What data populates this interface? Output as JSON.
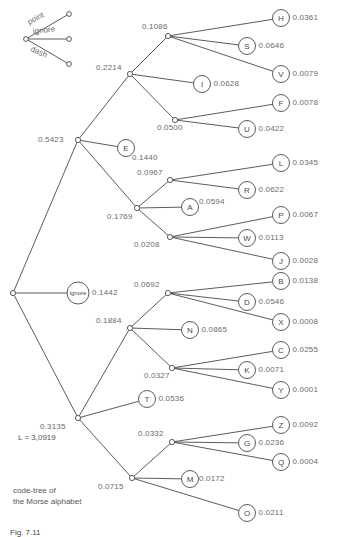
{
  "figure": {
    "title_lines": [
      "code-tree of",
      "the Morse alphabet"
    ],
    "cost_label": "L = 3,0919",
    "caption": "Fig. 7.11"
  },
  "legend": {
    "items": [
      {
        "name": "point",
        "label": "point"
      },
      {
        "name": "ignore",
        "label": "ignore"
      },
      {
        "name": "dash",
        "label": "dash"
      }
    ]
  },
  "chart_data": {
    "type": "tree",
    "cost": "L = 3,0919",
    "edge_types": [
      "point",
      "ignore",
      "dash"
    ],
    "internal_nodes": [
      {
        "id": "n-root",
        "value": "",
        "x": 13,
        "y": 293
      },
      {
        "id": "n-5423",
        "value": "0.5423",
        "x": 78,
        "y": 140
      },
      {
        "id": "n-2214",
        "value": "0.2214",
        "x": 130,
        "y": 74
      },
      {
        "id": "n-1086",
        "value": "0.1086",
        "x": 168,
        "y": 36
      },
      {
        "id": "n-0500",
        "value": "0.0500",
        "x": 175,
        "y": 120
      },
      {
        "id": "n-1769",
        "value": "0.1769",
        "x": 137,
        "y": 208
      },
      {
        "id": "n-0967",
        "value": "0.0967",
        "x": 170,
        "y": 180
      },
      {
        "id": "n-0208",
        "value": "0.0208",
        "x": 170,
        "y": 237
      },
      {
        "id": "n-3135",
        "value": "0.3135",
        "x": 78,
        "y": 418
      },
      {
        "id": "n-1884",
        "value": "0.1884",
        "x": 130,
        "y": 328
      },
      {
        "id": "n-0692",
        "value": "0.0692",
        "x": 168,
        "y": 293
      },
      {
        "id": "n-0327",
        "value": "0.0327",
        "x": 172,
        "y": 368
      },
      {
        "id": "n-0715",
        "value": "0.0715",
        "x": 132,
        "y": 478
      },
      {
        "id": "n-0332",
        "value": "0.0332",
        "x": 172,
        "y": 442
      }
    ],
    "leaves": [
      {
        "letter": "H",
        "value": "0.0361",
        "x": 281,
        "y": 18
      },
      {
        "letter": "S",
        "value": "0.0646",
        "x": 247,
        "y": 46
      },
      {
        "letter": "V",
        "value": "0.0079",
        "x": 281,
        "y": 74
      },
      {
        "letter": "I",
        "value": "0.0628",
        "x": 202,
        "y": 84
      },
      {
        "letter": "F",
        "value": "0.0078",
        "x": 281,
        "y": 103
      },
      {
        "letter": "U",
        "value": "0.0422",
        "x": 247,
        "y": 129
      },
      {
        "letter": "E",
        "value": "0.1440",
        "x": 126,
        "y": 148
      },
      {
        "letter": "L",
        "value": "0.0345",
        "x": 281,
        "y": 163
      },
      {
        "letter": "R",
        "value": "0.0622",
        "x": 247,
        "y": 190
      },
      {
        "letter": "A",
        "value": "0.0594",
        "x": 190,
        "y": 207
      },
      {
        "letter": "P",
        "value": "0.0067",
        "x": 281,
        "y": 215
      },
      {
        "letter": "W",
        "value": "0.0113",
        "x": 247,
        "y": 238
      },
      {
        "letter": "J",
        "value": "0.0028",
        "x": 281,
        "y": 261
      },
      {
        "letter": "ignore",
        "value": "0.1442",
        "x": 78,
        "y": 293
      },
      {
        "letter": "B",
        "value": "0.0138",
        "x": 281,
        "y": 281
      },
      {
        "letter": "D",
        "value": "0.0546",
        "x": 247,
        "y": 302
      },
      {
        "letter": "X",
        "value": "0.0008",
        "x": 281,
        "y": 322
      },
      {
        "letter": "N",
        "value": "0.0865",
        "x": 190,
        "y": 330
      },
      {
        "letter": "C",
        "value": "0.0255",
        "x": 281,
        "y": 350
      },
      {
        "letter": "K",
        "value": "0.0071",
        "x": 247,
        "y": 370
      },
      {
        "letter": "Y",
        "value": "0.0001",
        "x": 281,
        "y": 390
      },
      {
        "letter": "T",
        "value": "0.0536",
        "x": 147,
        "y": 399
      },
      {
        "letter": "Z",
        "value": "0.0092",
        "x": 281,
        "y": 425
      },
      {
        "letter": "G",
        "value": "0.0236",
        "x": 247,
        "y": 443
      },
      {
        "letter": "Q",
        "value": "0.0004",
        "x": 281,
        "y": 462
      },
      {
        "letter": "M",
        "value": "0.0172",
        "x": 190,
        "y": 479
      },
      {
        "letter": "O",
        "value": "0.0211",
        "x": 247,
        "y": 513
      }
    ]
  }
}
